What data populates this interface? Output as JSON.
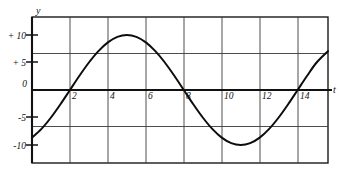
{
  "chart_data": {
    "type": "line",
    "title": "",
    "subtitle": "",
    "xlabel": "t",
    "ylabel": "y",
    "grid": true,
    "legend": null,
    "xlim": [
      0,
      15.6
    ],
    "ylim": [
      -13.3,
      13.3
    ],
    "x_ticks": [
      2,
      4,
      6,
      8,
      10,
      12,
      14
    ],
    "x_tick_labels": [
      "2",
      "4",
      "6",
      "8",
      "10",
      "12",
      "14"
    ],
    "y_ticks": [
      10,
      5,
      0,
      -5,
      -10
    ],
    "y_tick_labels": [
      "+ 10",
      "+ 5",
      "0",
      "-5",
      "-10"
    ],
    "x_gridlines": [
      2,
      4,
      6,
      8,
      10,
      12,
      14
    ],
    "y_gridlines": [
      6.67,
      0,
      -6.67
    ],
    "curve": {
      "name": "sinusoid",
      "equation_form": "y = 10 sin(2*pi*(t-2)/12)",
      "amplitude": 10,
      "period": 12,
      "phase_zero_crossing": 2,
      "zero_crossings": [
        2,
        8,
        14
      ],
      "maxima": [
        {
          "t": 5,
          "y": 10
        }
      ],
      "minima": [
        {
          "t": 11,
          "y": -10
        }
      ],
      "start_point": {
        "t": 0,
        "y": -8.7
      },
      "end_point": {
        "t": 15.6,
        "y": 7.1
      },
      "x": [
        0,
        0.5,
        1,
        1.5,
        2,
        2.5,
        3,
        3.5,
        4,
        4.5,
        5,
        5.5,
        6,
        6.5,
        7,
        7.5,
        8,
        8.5,
        9,
        9.5,
        10,
        10.5,
        11,
        11.5,
        12,
        12.5,
        13,
        13.5,
        14,
        14.5,
        15,
        15.6
      ],
      "y": [
        -8.66,
        -7.07,
        -5.0,
        -2.59,
        0.0,
        2.59,
        5.0,
        7.07,
        8.66,
        9.66,
        10.0,
        9.66,
        8.66,
        7.07,
        5.0,
        2.59,
        0.0,
        -2.59,
        -5.0,
        -7.07,
        -8.66,
        -9.66,
        -10.0,
        -9.66,
        -8.66,
        -7.07,
        -5.0,
        -2.59,
        0.0,
        2.59,
        5.0,
        7.07
      ]
    }
  },
  "axes": {
    "y_axis_label": "y",
    "x_axis_label": "t"
  }
}
